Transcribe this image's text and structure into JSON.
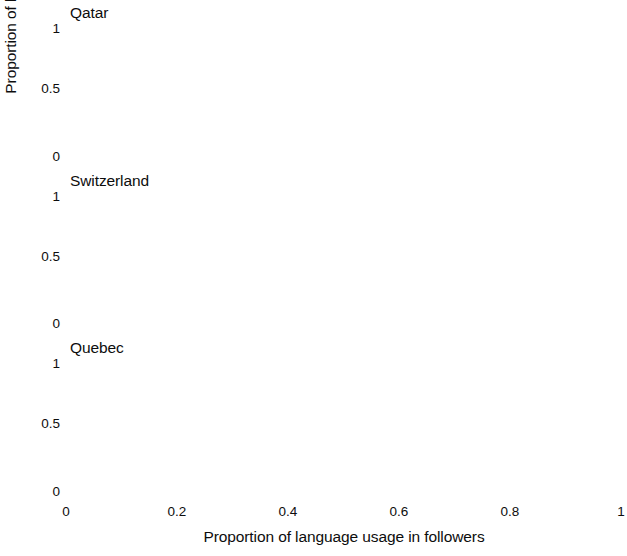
{
  "figure": {
    "xlabel": "Proportion of language usage in followers",
    "ylabel": "Proportion of language usage in a user",
    "xticks": [
      "0",
      "0.2",
      "0.4",
      "0.6",
      "0.8",
      "1"
    ],
    "yticks": [
      "0",
      "0.5",
      "1"
    ],
    "reference_line_value": "0.5"
  },
  "panels": [
    {
      "title": "Qatar"
    },
    {
      "title": "Switzerland"
    },
    {
      "title": "Quebec"
    }
  ],
  "legends": {
    "qatar": [
      {
        "label": "EN",
        "color": "#6e6e6e"
      },
      {
        "label": "AR",
        "color": "#8c8c8c"
      }
    ],
    "switzerland": [
      {
        "label": "EN",
        "color": "#6e6e6e"
      },
      {
        "label": "FR",
        "color": "#9a9a9a"
      },
      {
        "label": "DE",
        "color": "#7b7b7b"
      }
    ],
    "quebec": [
      {
        "label": "EN",
        "color": "#6e6e6e"
      },
      {
        "label": "FR",
        "color": "#8f8f8f"
      }
    ]
  },
  "chart_data": {
    "type": "line",
    "title": "",
    "xlabel": "Proportion of language usage in followers",
    "ylabel": "Proportion of language usage in a user",
    "xlim": [
      0,
      1
    ],
    "ylim": [
      0,
      1
    ],
    "xticks": [
      0,
      0.2,
      0.4,
      0.6,
      0.8,
      1
    ],
    "yticks": [
      0,
      0.5,
      1
    ],
    "grid": false,
    "reference_line": {
      "axis": "y",
      "value": 0.5,
      "style": "dashed"
    },
    "legend_position": "lower right (inside panel)",
    "panels": [
      {
        "panel_title": "Qatar",
        "x": [
          0.05,
          0.15,
          0.25,
          0.35,
          0.45,
          0.55,
          0.65,
          0.75,
          0.85,
          0.95
        ],
        "series": [
          {
            "name": "EN",
            "color": "#6e6e6e",
            "values": [
              0.325,
              0.355,
              0.385,
              0.415,
              0.455,
              0.497,
              0.538,
              0.578,
              0.625,
              0.68
            ]
          },
          {
            "name": "AR",
            "color": "#8c8c8c",
            "values": [
              0.33,
              0.358,
              0.387,
              0.417,
              0.455,
              0.495,
              0.532,
              0.57,
              0.608,
              0.645
            ]
          }
        ]
      },
      {
        "panel_title": "Switzerland",
        "x": [
          0.05,
          0.15,
          0.25,
          0.35,
          0.45,
          0.55,
          0.65,
          0.75,
          0.85,
          0.95
        ],
        "series": [
          {
            "name": "EN",
            "color": "#6e6e6e",
            "values": [
              0.312,
              0.352,
              0.392,
              0.428,
              0.462,
              0.497,
              0.535,
              0.573,
              0.612,
              0.66
            ]
          },
          {
            "name": "FR",
            "color": "#9a9a9a",
            "values": [
              0.305,
              0.34,
              0.375,
              0.408,
              0.448,
              0.492,
              0.533,
              0.572,
              0.612,
              0.658
            ]
          },
          {
            "name": "DE",
            "color": "#7b7b7b",
            "values": [
              0.318,
              0.352,
              0.385,
              0.415,
              0.445,
              0.475,
              0.51,
              0.552,
              0.6,
              0.652
            ]
          }
        ]
      },
      {
        "panel_title": "Quebec",
        "x": [
          0.05,
          0.15,
          0.25,
          0.35,
          0.45,
          0.55,
          0.65,
          0.75,
          0.85,
          0.95
        ],
        "series": [
          {
            "name": "EN",
            "color": "#6e6e6e",
            "values": [
              0.325,
              0.352,
              0.382,
              0.408,
              0.432,
              0.462,
              0.505,
              0.552,
              0.605,
              0.66
            ]
          },
          {
            "name": "FR",
            "color": "#8f8f8f",
            "values": [
              0.322,
              0.352,
              0.385,
              0.418,
              0.458,
              0.495,
              0.532,
              0.572,
              0.612,
              0.658
            ]
          }
        ]
      }
    ]
  }
}
